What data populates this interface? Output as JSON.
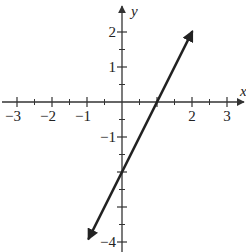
{
  "chart_data": {
    "type": "line",
    "title": "",
    "xlabel": "x",
    "ylabel": "y",
    "xlim": [
      -3.5,
      3.5
    ],
    "ylim": [
      -4,
      2.5
    ],
    "x_ticks": [
      -3,
      -2,
      -1,
      1,
      2,
      3
    ],
    "x_tick_labels": [
      "−3",
      "−2",
      "−1",
      "",
      "2",
      "3"
    ],
    "x_minor_ticks": [
      -2.5,
      -1.5,
      -0.5,
      0.5,
      1.5,
      2.5
    ],
    "y_ticks": [
      2,
      1,
      -1,
      -2,
      -3,
      -4
    ],
    "y_tick_labels": [
      "2",
      "1",
      "−1",
      "",
      "",
      "−4"
    ],
    "y_minor_ticks": [
      1.5,
      0.5,
      -0.5,
      -1.5,
      -2.5,
      -3.5
    ],
    "grid": false,
    "series": [
      {
        "name": "y = 2x − 2",
        "equation": "y = 2x - 2",
        "slope": 2,
        "intercept": -2,
        "x": [
          -0.95,
          0,
          1,
          2
        ],
        "y": [
          -3.9,
          -2,
          0,
          2
        ],
        "arrows": "both",
        "color": "#222222"
      }
    ],
    "x_intercept": 1,
    "y_intercept": -2
  },
  "style": {
    "axis_color": "#333333",
    "line_color": "#222222",
    "background": "#ffffff"
  }
}
